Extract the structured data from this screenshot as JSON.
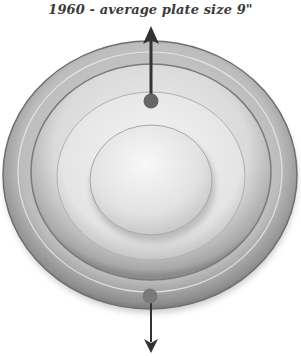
{
  "diagram": {
    "title": "1960 - average plate size 9\"",
    "elements": [
      {
        "name": "outer-plate-rim",
        "shape": "ellipse"
      },
      {
        "name": "middle-plate-ring",
        "shape": "ellipse"
      },
      {
        "name": "inner-plate-well",
        "shape": "ellipse"
      },
      {
        "name": "top-measure-dot",
        "shape": "circle"
      },
      {
        "name": "bottom-measure-dot",
        "shape": "circle"
      },
      {
        "name": "up-arrow",
        "shape": "arrow",
        "direction": "up"
      },
      {
        "name": "down-arrow",
        "shape": "arrow",
        "direction": "down"
      }
    ],
    "colors": {
      "rim": "#8a8a8a",
      "ring": "#c8c8c8",
      "dome": "#e6e6e6",
      "arrow": "#3a3a3a",
      "dot": "#666666"
    }
  }
}
